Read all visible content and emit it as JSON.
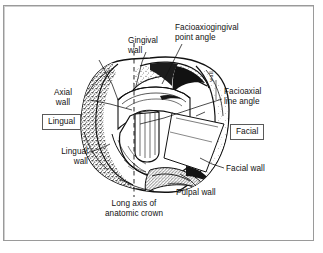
{
  "figure": {
    "background_color": "#ffffff",
    "frame_color": "#9a9a9a"
  },
  "labels": {
    "gingival_wall": "Gingival\nwall",
    "facioaxiogingival_point_angle": "Facioaxiogingival\npoint angle",
    "axial_wall": "Axial\nwall",
    "facioaxial_line_angle": "Facioaxial\nline angle",
    "lingual_wall": "Lingual\nwall",
    "facial_wall": "Facial wall",
    "pulpal_wall": "Pulpal wall",
    "long_axis": "Long axis of\nanatomic crown"
  },
  "orientation_labels": {
    "lingual": "Lingual",
    "facial": "Facial"
  },
  "colors": {
    "ink": "#111111",
    "box_border": "#5a5a5a",
    "frame": "#9a9a9a",
    "shading": "#2b2b2b"
  }
}
